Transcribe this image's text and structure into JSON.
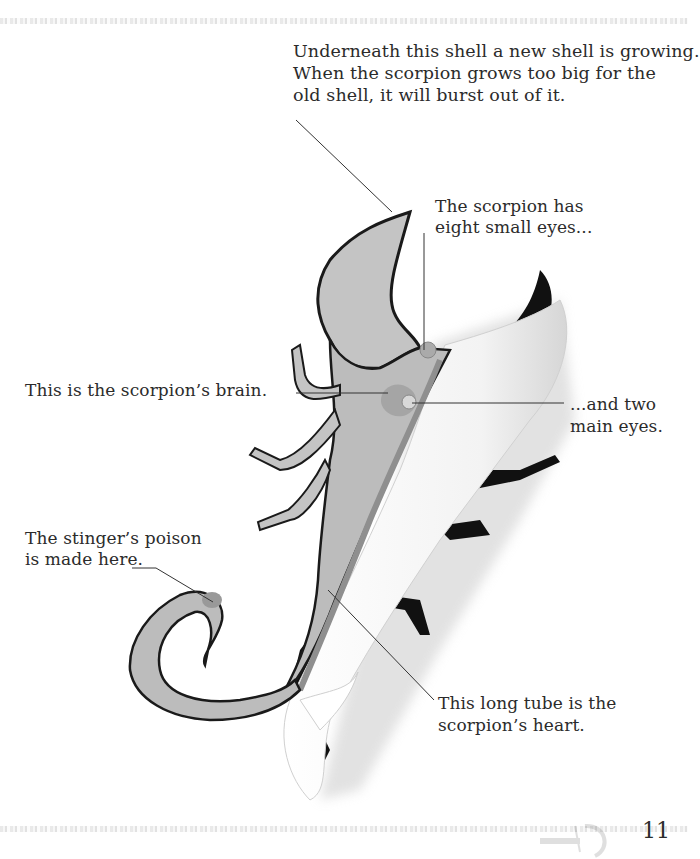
{
  "page": {
    "number": "11",
    "topic": "scorpion anatomy"
  },
  "labels": {
    "shell": "Underneath this shell a new shell is growing.\nWhen the scorpion grows too big for the\nold shell, it will burst out of it.",
    "small_eyes": "The scorpion has\neight small eyes...",
    "brain": "This is the scorpion’s brain.",
    "main_eyes": "...and two\nmain eyes.",
    "poison": "The stinger’s poison\nis made here.",
    "heart": "This long tube is the\nscorpion’s heart."
  },
  "colors": {
    "body_fill": "#bdbdbd",
    "outline": "#1a1a1a",
    "shell_exterior": "#111111",
    "organ": "#9a9a9a",
    "leader_line": "#333333"
  }
}
